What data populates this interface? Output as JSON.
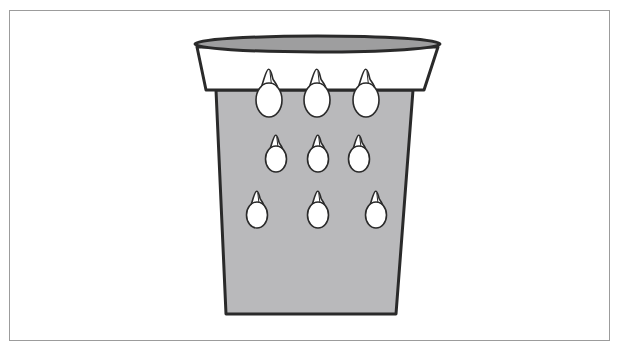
{
  "diagram": {
    "colors": {
      "background": "#ffffff",
      "frame_border": "#9c9c9c",
      "outline": "#2a2a2a",
      "cup_body": "#b9b9bb",
      "cup_rim_opening": "#9e9e9f",
      "cup_collar": "#ffffff",
      "seed_fill": "#ffffff"
    },
    "cup": {
      "rim": {
        "left": 195,
        "right": 440,
        "top_y": 36,
        "center_y": 44
      },
      "collar": {
        "top_left": [
          197,
          47
        ],
        "top_right": [
          438,
          47
        ],
        "bottom_left": [
          206,
          90
        ],
        "bottom_right": [
          424,
          90
        ]
      },
      "body": {
        "top_left": [
          216,
          90
        ],
        "top_right": [
          413,
          90
        ],
        "bottom_left": [
          226,
          314
        ],
        "bottom_right": [
          396,
          314
        ]
      }
    },
    "seeds": [
      {
        "row": 1,
        "cx": 269,
        "cy": 99,
        "rx": 13,
        "ry": 17
      },
      {
        "row": 1,
        "cx": 317,
        "cy": 99,
        "rx": 13,
        "ry": 17
      },
      {
        "row": 1,
        "cx": 366,
        "cy": 99,
        "rx": 13,
        "ry": 17
      },
      {
        "row": 2,
        "cx": 276,
        "cy": 158,
        "rx": 10.5,
        "ry": 13
      },
      {
        "row": 2,
        "cx": 318,
        "cy": 158,
        "rx": 10.5,
        "ry": 13
      },
      {
        "row": 2,
        "cx": 359,
        "cy": 158,
        "rx": 10.5,
        "ry": 13
      },
      {
        "row": 3,
        "cx": 257,
        "cy": 214,
        "rx": 10.5,
        "ry": 13
      },
      {
        "row": 3,
        "cx": 318,
        "cy": 214,
        "rx": 10.5,
        "ry": 13
      },
      {
        "row": 3,
        "cx": 376,
        "cy": 214,
        "rx": 10.5,
        "ry": 13
      }
    ]
  }
}
